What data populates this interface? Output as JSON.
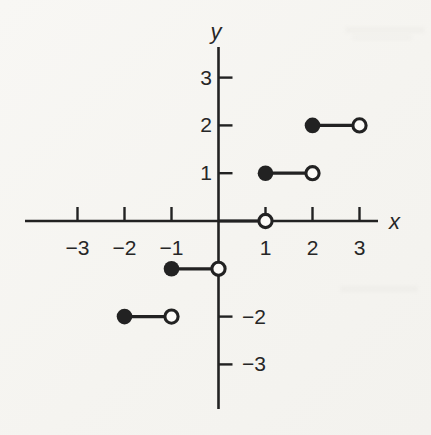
{
  "colors": {
    "ink": "#222222",
    "paper": "#f6f5f2",
    "open_marker_fill": "#fcfbf8"
  },
  "chart_data": {
    "type": "line",
    "subtype": "step-function",
    "title": "",
    "xlabel": "x",
    "ylabel": "y",
    "xlim": [
      -4.1,
      3.4
    ],
    "ylim": [
      -3.95,
      3.65
    ],
    "grid": false,
    "legend": false,
    "x_ticks": [
      {
        "value": -3,
        "label": "−3"
      },
      {
        "value": -2,
        "label": "−2"
      },
      {
        "value": -1,
        "label": "−1"
      },
      {
        "value": 1,
        "label": "1"
      },
      {
        "value": 2,
        "label": "2"
      },
      {
        "value": 3,
        "label": "3"
      }
    ],
    "y_ticks": [
      {
        "value": 3,
        "label": "3",
        "label_side": "left"
      },
      {
        "value": 2,
        "label": "2",
        "label_side": "left"
      },
      {
        "value": 1,
        "label": "1",
        "label_side": "left"
      },
      {
        "value": -2,
        "label": "−2",
        "label_side": "right"
      },
      {
        "value": -3,
        "label": "−3",
        "label_side": "right"
      }
    ],
    "series": [
      {
        "name": "floor-step-function",
        "segments": [
          {
            "y": 2,
            "from_x": 2,
            "to_x": 3,
            "from_closed": true,
            "to_closed": false,
            "show_from_marker": true
          },
          {
            "y": 1,
            "from_x": 1,
            "to_x": 2,
            "from_closed": true,
            "to_closed": false,
            "show_from_marker": true
          },
          {
            "y": 0,
            "from_x": 0,
            "to_x": 1,
            "from_closed": true,
            "to_closed": false,
            "show_from_marker": false
          },
          {
            "y": -1,
            "from_x": -1,
            "to_x": 0,
            "from_closed": true,
            "to_closed": false,
            "show_from_marker": true
          },
          {
            "y": -2,
            "from_x": -2,
            "to_x": -1,
            "from_closed": true,
            "to_closed": false,
            "show_from_marker": true
          }
        ]
      }
    ]
  }
}
